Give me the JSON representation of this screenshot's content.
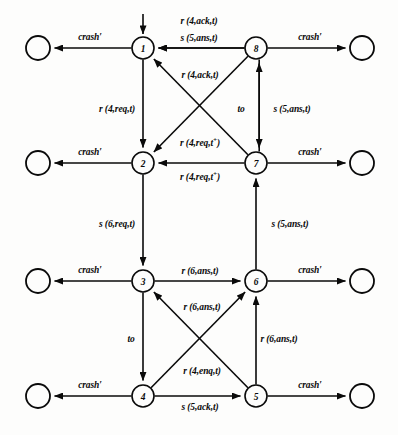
{
  "figure": {
    "type": "state-transition-diagram",
    "background": "#fdfdfc",
    "ink": "#0a0a0a",
    "stroke_width": 1.6
  },
  "geometry": {
    "col_left_x": 143,
    "col_right_x": 256,
    "sink_left_x": 38,
    "sink_right_x": 362,
    "rows_y": [
      48,
      163,
      281,
      396
    ],
    "state_radius": 11,
    "sink_radius": 12
  },
  "states": [
    {
      "id": "1",
      "label": "1",
      "x": 143,
      "y": 48
    },
    {
      "id": "8",
      "label": "8",
      "x": 256,
      "y": 48
    },
    {
      "id": "2",
      "label": "2",
      "x": 143,
      "y": 163
    },
    {
      "id": "7",
      "label": "7",
      "x": 256,
      "y": 163
    },
    {
      "id": "3",
      "label": "3",
      "x": 143,
      "y": 281
    },
    {
      "id": "6",
      "label": "6",
      "x": 256,
      "y": 281
    },
    {
      "id": "4",
      "label": "4",
      "x": 143,
      "y": 396
    },
    {
      "id": "5",
      "label": "5",
      "x": 256,
      "y": 396
    }
  ],
  "crash_states": [
    {
      "id": "crash-1",
      "x": 38,
      "y": 48
    },
    {
      "id": "crash-8",
      "x": 362,
      "y": 48
    },
    {
      "id": "crash-2",
      "x": 38,
      "y": 163
    },
    {
      "id": "crash-7",
      "x": 362,
      "y": 163
    },
    {
      "id": "crash-3",
      "x": 38,
      "y": 281
    },
    {
      "id": "crash-6",
      "x": 362,
      "y": 281
    },
    {
      "id": "crash-4",
      "x": 38,
      "y": 396
    },
    {
      "id": "crash-5",
      "x": 362,
      "y": 396
    }
  ],
  "initial_marker": {
    "target": "1",
    "x": 143,
    "y_from": 14,
    "y_to": 34
  },
  "labels": {
    "crash": "crash",
    "crash_prime": "crash′",
    "to": "to"
  },
  "transitions": [
    {
      "id": "t-8-1-a",
      "from": "8",
      "to": "1",
      "label_main": "r (4,ack,t)",
      "sup": "",
      "x": 199,
      "y": 22
    },
    {
      "id": "t-8-1-b",
      "from": "8",
      "to": "1",
      "label_main": "s (5,ans,t)",
      "sup": "",
      "x": 199,
      "y": 39
    },
    {
      "id": "t-7-1",
      "from": "7",
      "to": "1",
      "label_main": "r (4,ack,t)",
      "sup": "",
      "x": 200,
      "y": 76
    },
    {
      "id": "t-1-2",
      "from": "1",
      "to": "2",
      "label_main": "r (4,req,t)",
      "sup": "",
      "x": 117,
      "y": 110
    },
    {
      "id": "t-8-2",
      "from": "8",
      "to": "2",
      "label_main": "r (4,req,t",
      "sup": "+",
      "x": 200,
      "y": 143
    },
    {
      "id": "t-7-2",
      "from": "7",
      "to": "2",
      "label_main": "r (4,req,t",
      "sup": "+",
      "x": 200,
      "y": 177
    },
    {
      "id": "t-7-8",
      "from": "7",
      "to": "8",
      "label_main": "to",
      "sup": "",
      "x": 241,
      "y": 110
    },
    {
      "id": "t-8-7",
      "from": "8",
      "to": "7",
      "label_main": "s (5,ans,t)",
      "sup": "",
      "x": 292,
      "y": 110
    },
    {
      "id": "t-2-3",
      "from": "2",
      "to": "3",
      "label_main": "s (6,req,t)",
      "sup": "",
      "x": 117,
      "y": 225
    },
    {
      "id": "t-6-7",
      "from": "6",
      "to": "7",
      "label_main": "s (5,ans,t)",
      "sup": "",
      "x": 290,
      "y": 225
    },
    {
      "id": "t-3-6",
      "from": "3",
      "to": "6",
      "label_main": "r (6,ans,t)",
      "sup": "",
      "x": 200,
      "y": 272
    },
    {
      "id": "t-5-3",
      "from": "5",
      "to": "3",
      "label_main": "r (6,ans,t)",
      "sup": "",
      "x": 202,
      "y": 308
    },
    {
      "id": "t-3-4",
      "from": "3",
      "to": "4",
      "label_main": "to",
      "sup": "",
      "x": 131,
      "y": 340
    },
    {
      "id": "t-5-6",
      "from": "5",
      "to": "6",
      "label_main": "r (6,ans,t)",
      "sup": "",
      "x": 279,
      "y": 340
    },
    {
      "id": "t-4-6",
      "from": "4",
      "to": "6",
      "label_main": "r (4,enq,t)",
      "sup": "",
      "x": 202,
      "y": 372
    },
    {
      "id": "t-4-5",
      "from": "4",
      "to": "5",
      "label_main": "s (5,ack,t)",
      "sup": "",
      "x": 200,
      "y": 408
    }
  ],
  "crash_transitions": [
    {
      "id": "c-1",
      "from": "1",
      "to": "crash-1",
      "label": "crash′",
      "x": 90,
      "y": 38
    },
    {
      "id": "c-8",
      "from": "8",
      "to": "crash-8",
      "label": "crash′",
      "x": 310,
      "y": 38
    },
    {
      "id": "c-2",
      "from": "2",
      "to": "crash-2",
      "label": "crash′",
      "x": 90,
      "y": 153
    },
    {
      "id": "c-7",
      "from": "7",
      "to": "crash-7",
      "label": "crash′",
      "x": 310,
      "y": 153
    },
    {
      "id": "c-3",
      "from": "3",
      "to": "crash-3",
      "label": "crash′",
      "x": 90,
      "y": 271
    },
    {
      "id": "c-6",
      "from": "6",
      "to": "crash-6",
      "label": "crash′",
      "x": 310,
      "y": 271
    },
    {
      "id": "c-4",
      "from": "4",
      "to": "crash-4",
      "label": "crash′",
      "x": 90,
      "y": 386
    },
    {
      "id": "c-5",
      "from": "5",
      "to": "crash-5",
      "label": "crash′",
      "x": 310,
      "y": 386
    }
  ]
}
